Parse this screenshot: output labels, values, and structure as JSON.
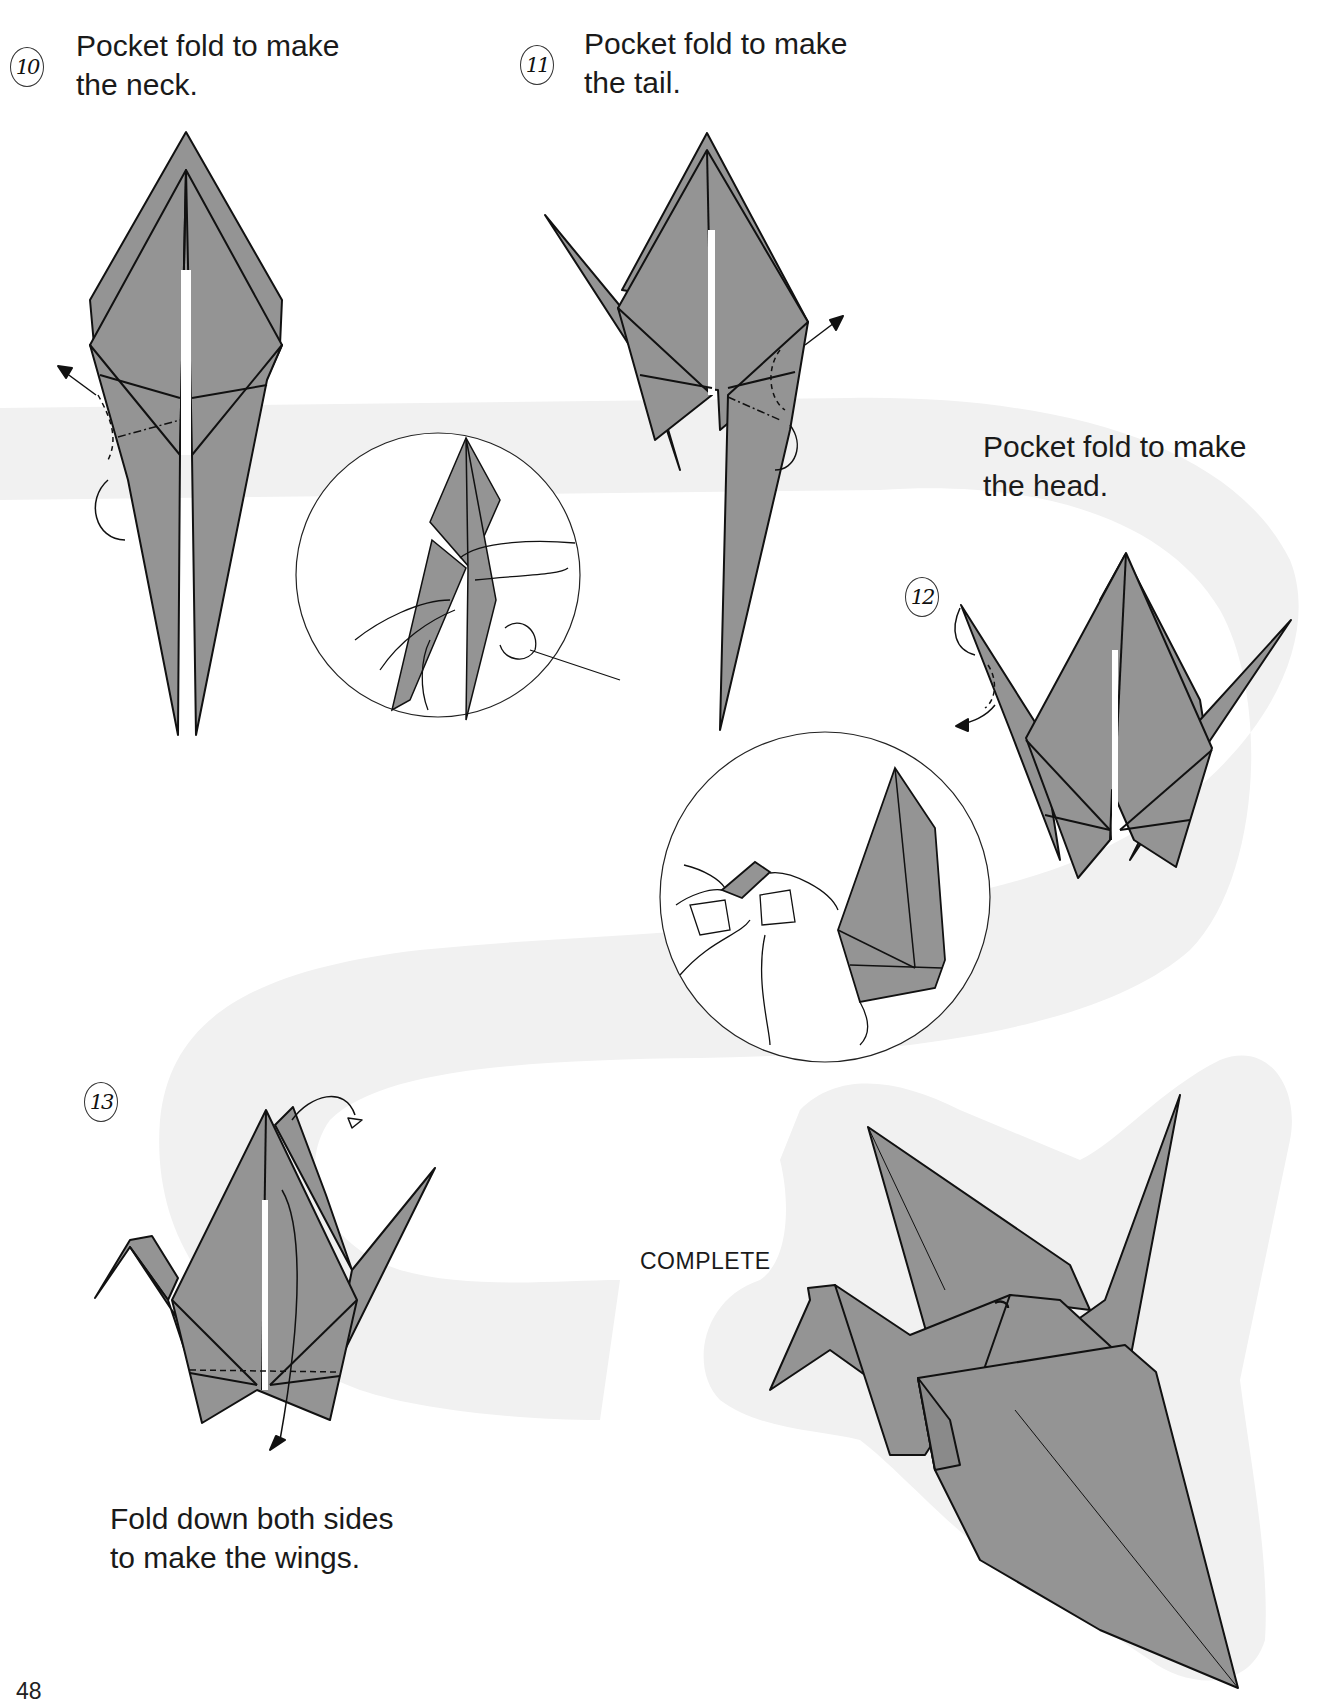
{
  "page": {
    "page_number": "48",
    "colors": {
      "paper_fill": "#949494",
      "stroke": "#111111",
      "band": "#f1f1f1"
    }
  },
  "steps": [
    {
      "number": "10",
      "caption_lines": [
        "Pocket fold to make",
        "the neck."
      ]
    },
    {
      "number": "11",
      "caption_lines": [
        "Pocket fold to make",
        "the tail."
      ]
    },
    {
      "number": "12",
      "caption_lines": [
        "Pocket fold to make",
        "the head."
      ]
    },
    {
      "number": "13",
      "caption_lines": [
        "Fold down both sides",
        "to make the wings."
      ]
    }
  ],
  "complete_label": "COMPLETE",
  "figures": {
    "step10": "crane-base-neck-fold-diagram",
    "step11": "crane-base-tail-fold-diagram",
    "detail1": "hands-pocket-fold-detail",
    "step12": "crane-head-fold-diagram",
    "detail2": "hands-head-fold-detail",
    "step13": "crane-wings-fold-diagram",
    "complete": "completed-paper-crane"
  }
}
